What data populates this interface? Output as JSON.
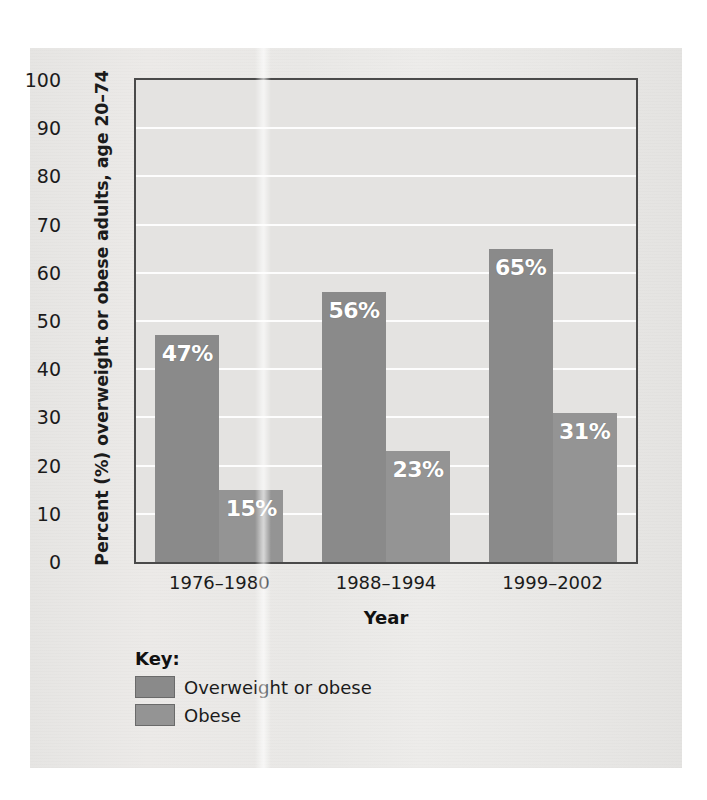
{
  "chart_data": {
    "type": "bar",
    "title": "",
    "xlabel": "Year",
    "ylabel": "Percent (%) overweight or obese adults, age 20–74",
    "categories": [
      "1976–1980",
      "1988–1994",
      "1999–2002"
    ],
    "series": [
      {
        "name": "Overweight or obese",
        "color": "#8a8a8a",
        "values": [
          47,
          56,
          65
        ],
        "value_labels": [
          "47%",
          "56%",
          "65%"
        ]
      },
      {
        "name": "Obese",
        "color": "#949494",
        "values": [
          15,
          23,
          31
        ],
        "value_labels": [
          "15%",
          "23%",
          "31%"
        ]
      }
    ],
    "ylim": [
      0,
      100
    ],
    "yticks": [
      0,
      10,
      20,
      30,
      40,
      50,
      60,
      70,
      80,
      90,
      100
    ],
    "ytick_labels": [
      "0",
      "10",
      "20",
      "30",
      "40",
      "50",
      "60",
      "70",
      "80",
      "90",
      "100"
    ],
    "grid": true,
    "gridline_color": "#fdfdfd",
    "plot_background": "#e4e3e1",
    "axis_color": "#4a4a4a",
    "legend_position": "below-left",
    "legend_title": "Key:"
  },
  "legend": {
    "title": "Key:",
    "entries": [
      {
        "label": "Overweight or obese",
        "color": "#8a8a8a"
      },
      {
        "label": "Obese",
        "color": "#949494"
      }
    ]
  },
  "axes": {
    "x_title": "Year",
    "y_title": "Percent (%) overweight or obese adults, age 20–74"
  }
}
